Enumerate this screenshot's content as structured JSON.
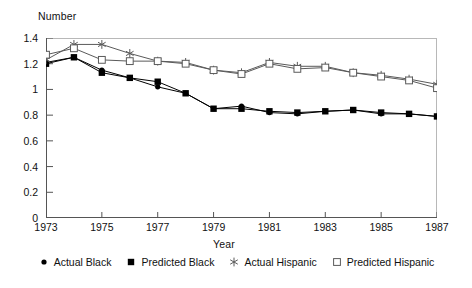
{
  "chart_data": {
    "type": "line",
    "title": "",
    "ylabel": "Number",
    "xlabel": "Year",
    "x": [
      1973,
      1974,
      1975,
      1976,
      1977,
      1978,
      1979,
      1980,
      1981,
      1982,
      1983,
      1984,
      1985,
      1986,
      1987
    ],
    "xlim": [
      1973,
      1987
    ],
    "ylim": [
      0,
      1.4
    ],
    "yticks": [
      "0",
      "0.2",
      "0.4",
      "0.6",
      "0.8",
      "1",
      "1.2",
      "1.4"
    ],
    "ytick_values": [
      0,
      0.2,
      0.4,
      0.6,
      0.8,
      1.0,
      1.2,
      1.4
    ],
    "xticks": [
      "1973",
      "1975",
      "1977",
      "1979",
      "1981",
      "1983",
      "1985",
      "1987"
    ],
    "xtick_values": [
      1973,
      1975,
      1977,
      1979,
      1981,
      1983,
      1985,
      1987
    ],
    "grid": false,
    "legend_position": "bottom",
    "series": [
      {
        "name": "Actual Black",
        "marker": "filled-circle",
        "color": "#000000",
        "values": [
          1.21,
          1.25,
          1.15,
          1.09,
          1.02,
          0.97,
          0.85,
          0.87,
          0.82,
          0.81,
          0.83,
          0.84,
          0.81,
          0.81,
          0.79
        ]
      },
      {
        "name": "Predicted Black",
        "marker": "filled-square",
        "color": "#000000",
        "values": [
          1.2,
          1.25,
          1.13,
          1.09,
          1.06,
          0.97,
          0.85,
          0.85,
          0.83,
          0.82,
          0.83,
          0.84,
          0.82,
          0.81,
          0.79
        ]
      },
      {
        "name": "Actual Hispanic",
        "marker": "star",
        "color": "#5a5a5a",
        "values": [
          1.23,
          1.35,
          1.35,
          1.28,
          1.22,
          1.21,
          1.15,
          1.13,
          1.21,
          1.18,
          1.18,
          1.13,
          1.11,
          1.08,
          1.04
        ]
      },
      {
        "name": "Predicted Hispanic",
        "marker": "open-square",
        "color": "#5a5a5a",
        "values": [
          1.27,
          1.32,
          1.23,
          1.22,
          1.22,
          1.2,
          1.15,
          1.12,
          1.2,
          1.16,
          1.17,
          1.13,
          1.1,
          1.07,
          1.01
        ]
      }
    ]
  },
  "legend": {
    "items": [
      {
        "label": "Actual Black",
        "marker": "filled-circle"
      },
      {
        "label": "Predicted Black",
        "marker": "filled-square"
      },
      {
        "label": "Actual Hispanic",
        "marker": "star"
      },
      {
        "label": "Predicted Hispanic",
        "marker": "open-square"
      }
    ]
  }
}
